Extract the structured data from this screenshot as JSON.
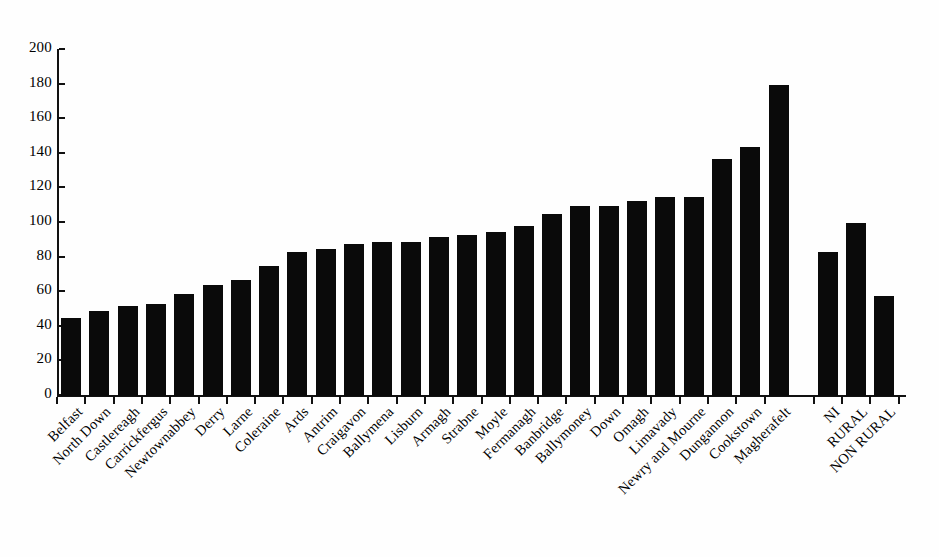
{
  "chart_data": {
    "type": "bar",
    "title": "",
    "subtitle": "",
    "xlabel": "",
    "ylabel": "",
    "ylim": [
      0,
      200
    ],
    "ytick_step": 20,
    "yticks": [
      0,
      20,
      40,
      60,
      80,
      100,
      120,
      140,
      160,
      180,
      200
    ],
    "grid": false,
    "legend": "none",
    "bar_color": "#0a0a0a",
    "categories": [
      "Belfast",
      "North Down",
      "Castlereagh",
      "Carrickfergus",
      "Newtownabbey",
      "Derry",
      "Larne",
      "Coleraine",
      "Ards",
      "Antrim",
      "Craigavon",
      "Ballymena",
      "Lisburn",
      "Armagh",
      "Strabne",
      "Moyle",
      "Fermanagh",
      "Banbridge",
      "Ballymoney",
      "Down",
      "Omagh",
      "Limavady",
      "Newry and Mourne",
      "Dungannon",
      "Cookstown",
      "Magherafelt",
      "NI",
      "RURAL",
      "NON RURAL"
    ],
    "values": [
      45,
      49,
      52,
      53,
      59,
      64,
      67,
      75,
      83,
      85,
      88,
      89,
      89,
      92,
      93,
      95,
      98,
      105,
      110,
      110,
      113,
      115,
      115,
      137,
      144,
      180,
      83,
      100,
      58
    ],
    "gap_after_index": 25
  },
  "axis": {
    "y_labels": [
      "0",
      "20",
      "40",
      "60",
      "80",
      "100",
      "120",
      "140",
      "160",
      "180",
      "200"
    ]
  }
}
